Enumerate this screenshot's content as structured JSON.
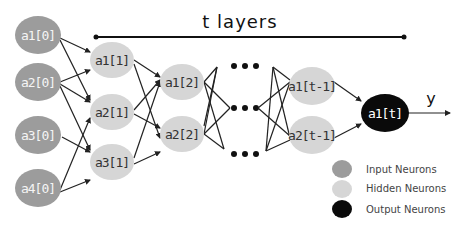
{
  "diagram": {
    "title": "t layers",
    "output_label": "y",
    "colors": {
      "input": "#9c9c9c",
      "hidden": "#d6d6d6",
      "output": "#0a0a0a",
      "edge": "#222222"
    },
    "layers": {
      "input": [
        "a1[0]",
        "a2[0]",
        "a3[0]",
        "a4[0]"
      ],
      "hidden1": [
        "a1[1]",
        "a2[1]",
        "a3[1]"
      ],
      "hidden2": [
        "a1[2]",
        "a2[2]"
      ],
      "hidden_t_minus_1": [
        "a1[t-1]",
        "a2[t-1]"
      ],
      "output": [
        "a1[t]"
      ]
    },
    "ellipsis": "...",
    "legend": [
      {
        "label": "Input Neurons",
        "color": "#9c9c9c"
      },
      {
        "label": "Hidden Neurons",
        "color": "#d6d6d6"
      },
      {
        "label": "Output Neurons",
        "color": "#0a0a0a"
      }
    ]
  }
}
